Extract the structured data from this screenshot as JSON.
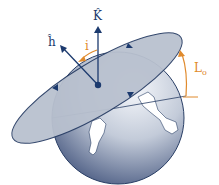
{
  "diagram": {
    "labels": {
      "k_vector": "K̂",
      "h_vector": "ĥ",
      "inclination": "i",
      "longitude": "L",
      "longitude_sub": "o"
    },
    "colors": {
      "vector": "#1c3a6e",
      "angle": "#e08a2c",
      "plane_fill": "#b9c1cf",
      "plane_edge": "#2a3f66",
      "globe_dark": "#3d5079",
      "globe_light": "#f3f5f9",
      "land": "#ffffff"
    }
  }
}
